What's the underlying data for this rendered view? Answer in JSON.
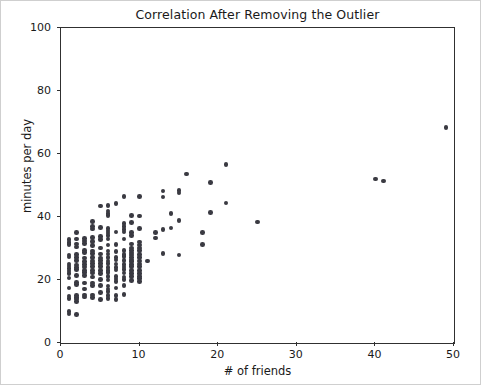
{
  "figure": {
    "width": 481,
    "height": 385,
    "background": "#ffffff",
    "border_color": "#cfcfcf",
    "marker_color": "#3a3a42",
    "axis_color": "#303030"
  },
  "chart_data": {
    "type": "scatter",
    "title": "Correlation After Removing the Outlier",
    "xlabel": "# of friends",
    "ylabel": "minutes per day",
    "xlim": [
      0,
      50
    ],
    "ylim": [
      0,
      100
    ],
    "xticks": [
      0,
      10,
      20,
      30,
      40,
      50
    ],
    "yticks": [
      0,
      20,
      40,
      60,
      80,
      100
    ],
    "xtick_labels": [
      "0",
      "10",
      "20",
      "30",
      "40",
      "50"
    ],
    "ytick_labels": [
      "0",
      "20",
      "40",
      "60",
      "80",
      "100"
    ],
    "grid": false,
    "legend": null,
    "series_name": "users",
    "marker": "circle",
    "points": [
      [
        1,
        9.2
      ],
      [
        1,
        10.0
      ],
      [
        1,
        14.2
      ],
      [
        1,
        14.9
      ],
      [
        1,
        17.4
      ],
      [
        1,
        20.6
      ],
      [
        1,
        22.0
      ],
      [
        1,
        22.9
      ],
      [
        1,
        23.6
      ],
      [
        1,
        24.4
      ],
      [
        1,
        25.1
      ],
      [
        1,
        27.3
      ],
      [
        1,
        28.0
      ],
      [
        1,
        31.2
      ],
      [
        1,
        31.9
      ],
      [
        1,
        32.9
      ],
      [
        2,
        9.1
      ],
      [
        2,
        13.2
      ],
      [
        2,
        14.0
      ],
      [
        2,
        14.5
      ],
      [
        2,
        15.1
      ],
      [
        2,
        18.6
      ],
      [
        2,
        19.3
      ],
      [
        2,
        21.5
      ],
      [
        2,
        23.3
      ],
      [
        2,
        24.0
      ],
      [
        2,
        24.8
      ],
      [
        2,
        26.1
      ],
      [
        2,
        27.2
      ],
      [
        2,
        28.1
      ],
      [
        2,
        30.5
      ],
      [
        2,
        31.4
      ],
      [
        2,
        33.0
      ],
      [
        2,
        35.1
      ],
      [
        3,
        14.6
      ],
      [
        3,
        15.2
      ],
      [
        3,
        17.2
      ],
      [
        3,
        19.0
      ],
      [
        3,
        21.5
      ],
      [
        3,
        22.4
      ],
      [
        3,
        23.1
      ],
      [
        3,
        24.1
      ],
      [
        3,
        25.0
      ],
      [
        3,
        25.8
      ],
      [
        3,
        27.0
      ],
      [
        3,
        28.7
      ],
      [
        3,
        29.4
      ],
      [
        3,
        31.5
      ],
      [
        3,
        32.4
      ],
      [
        3,
        33.1
      ],
      [
        4,
        14.5
      ],
      [
        4,
        15.3
      ],
      [
        4,
        18.2
      ],
      [
        4,
        19.1
      ],
      [
        4,
        21.0
      ],
      [
        4,
        22.2
      ],
      [
        4,
        23.0
      ],
      [
        4,
        24.3
      ],
      [
        4,
        25.2
      ],
      [
        4,
        26.0
      ],
      [
        4,
        27.1
      ],
      [
        4,
        28.4
      ],
      [
        4,
        29.2
      ],
      [
        4,
        31.0
      ],
      [
        4,
        32.3
      ],
      [
        4,
        33.4
      ],
      [
        4,
        36.2
      ],
      [
        4,
        37.0
      ],
      [
        4,
        38.6
      ],
      [
        5,
        13.9
      ],
      [
        5,
        16.0
      ],
      [
        5,
        18.3
      ],
      [
        5,
        20.2
      ],
      [
        5,
        22.1
      ],
      [
        5,
        23.0
      ],
      [
        5,
        24.2
      ],
      [
        5,
        25.3
      ],
      [
        5,
        26.1
      ],
      [
        5,
        27.0
      ],
      [
        5,
        28.2
      ],
      [
        5,
        30.1
      ],
      [
        5,
        32.9
      ],
      [
        5,
        33.8
      ],
      [
        5,
        36.7
      ],
      [
        5,
        43.5
      ],
      [
        6,
        14.1
      ],
      [
        6,
        15.0
      ],
      [
        6,
        16.3
      ],
      [
        6,
        17.2
      ],
      [
        6,
        18.1
      ],
      [
        6,
        20.0
      ],
      [
        6,
        21.2
      ],
      [
        6,
        22.4
      ],
      [
        6,
        23.1
      ],
      [
        6,
        24.0
      ],
      [
        6,
        25.2
      ],
      [
        6,
        26.0
      ],
      [
        6,
        27.1
      ],
      [
        6,
        28.3
      ],
      [
        6,
        29.2
      ],
      [
        6,
        31.1
      ],
      [
        6,
        33.0
      ],
      [
        6,
        34.2
      ],
      [
        6,
        34.9
      ],
      [
        6,
        35.6
      ],
      [
        6,
        36.3
      ],
      [
        6,
        40.4
      ],
      [
        6,
        41.2
      ],
      [
        6,
        41.9
      ],
      [
        6,
        43.6
      ],
      [
        7,
        13.8
      ],
      [
        7,
        15.1
      ],
      [
        7,
        17.4
      ],
      [
        7,
        19.5
      ],
      [
        7,
        20.3
      ],
      [
        7,
        21.1
      ],
      [
        7,
        23.2
      ],
      [
        7,
        24.0
      ],
      [
        7,
        25.1
      ],
      [
        7,
        26.3
      ],
      [
        7,
        27.2
      ],
      [
        7,
        29.0
      ],
      [
        7,
        31.2
      ],
      [
        7,
        35.3
      ],
      [
        7,
        44.2
      ],
      [
        8,
        15.4
      ],
      [
        8,
        18.3
      ],
      [
        8,
        20.1
      ],
      [
        8,
        21.0
      ],
      [
        8,
        22.2
      ],
      [
        8,
        23.4
      ],
      [
        8,
        24.1
      ],
      [
        8,
        25.0
      ],
      [
        8,
        26.2
      ],
      [
        8,
        27.4
      ],
      [
        8,
        28.1
      ],
      [
        8,
        29.3
      ],
      [
        8,
        33.0
      ],
      [
        8,
        35.2
      ],
      [
        8,
        36.1
      ],
      [
        8,
        37.0
      ],
      [
        8,
        37.9
      ],
      [
        8,
        46.6
      ],
      [
        9,
        19.8
      ],
      [
        9,
        21.2
      ],
      [
        9,
        22.0
      ],
      [
        9,
        23.1
      ],
      [
        9,
        24.3
      ],
      [
        9,
        25.0
      ],
      [
        9,
        25.8
      ],
      [
        9,
        26.4
      ],
      [
        9,
        27.1
      ],
      [
        9,
        27.9
      ],
      [
        9,
        28.6
      ],
      [
        9,
        29.3
      ],
      [
        9,
        30.1
      ],
      [
        9,
        31.4
      ],
      [
        9,
        34.2
      ],
      [
        9,
        35.0
      ],
      [
        9,
        38.2
      ],
      [
        9,
        40.5
      ],
      [
        10,
        19.5
      ],
      [
        10,
        20.4
      ],
      [
        10,
        21.2
      ],
      [
        10,
        22.1
      ],
      [
        10,
        23.0
      ],
      [
        10,
        24.2
      ],
      [
        10,
        25.1
      ],
      [
        10,
        26.0
      ],
      [
        10,
        27.2
      ],
      [
        10,
        28.1
      ],
      [
        10,
        29.4
      ],
      [
        10,
        30.2
      ],
      [
        10,
        31.1
      ],
      [
        10,
        32.0
      ],
      [
        10,
        36.4
      ],
      [
        10,
        40.3
      ],
      [
        10,
        46.5
      ],
      [
        11,
        26.0
      ],
      [
        12,
        33.3
      ],
      [
        12,
        35.0
      ],
      [
        13,
        28.4
      ],
      [
        13,
        36.0
      ],
      [
        13,
        46.4
      ],
      [
        13,
        48.3
      ],
      [
        14,
        36.5
      ],
      [
        14,
        41.1
      ],
      [
        15,
        27.9
      ],
      [
        15,
        38.8
      ],
      [
        15,
        47.6
      ],
      [
        15,
        48.5
      ],
      [
        16,
        53.6
      ],
      [
        18,
        31.3
      ],
      [
        18,
        35.0
      ],
      [
        19,
        41.4
      ],
      [
        19,
        51.0
      ],
      [
        21,
        44.4
      ],
      [
        21,
        56.7
      ],
      [
        25,
        38.4
      ],
      [
        40,
        52.0
      ],
      [
        41,
        51.4
      ],
      [
        49,
        68.5
      ]
    ]
  }
}
